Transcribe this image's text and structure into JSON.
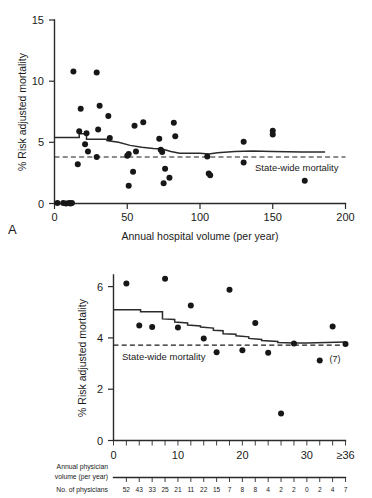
{
  "figure": {
    "panels": [
      {
        "letter": "A",
        "y_axis_title": "% Risk adjusted mortality",
        "x_axis_title": "Annual hospital volume (per year)",
        "annotation": "State-wide mortality"
      },
      {
        "letter": "B",
        "y_axis_title": "% Risk adjusted mortality",
        "x_axis_title_line1": "Annual physician",
        "x_axis_title_line2": "volume (per year)",
        "counts_label": "No. of physicians",
        "annotation": "State-wide mortality",
        "point_note": "(7)"
      }
    ]
  },
  "chart_data": [
    {
      "type": "scatter",
      "title": "A",
      "xlabel": "Annual hospital volume (per year)",
      "ylabel": "% Risk adjusted mortality",
      "xlim": [
        0,
        200
      ],
      "ylim": [
        0,
        15
      ],
      "xticks": [
        0,
        50,
        100,
        150,
        200
      ],
      "yticks": [
        0,
        5,
        10,
        15
      ],
      "xtick_labels": [
        "0",
        "50",
        "100",
        "150",
        "200"
      ],
      "ytick_labels": [
        "0",
        "5",
        "10",
        "15"
      ],
      "grid": false,
      "legend": "none",
      "points": [
        [
          2,
          0.05
        ],
        [
          6,
          0.05
        ],
        [
          8,
          0.0
        ],
        [
          10,
          0.05
        ],
        [
          11,
          0.0
        ],
        [
          12,
          0.05
        ],
        [
          13,
          10.8
        ],
        [
          16,
          3.2
        ],
        [
          17,
          5.9
        ],
        [
          18,
          7.75
        ],
        [
          21,
          4.85
        ],
        [
          22,
          5.75
        ],
        [
          23,
          4.25
        ],
        [
          29,
          10.7
        ],
        [
          29,
          3.8
        ],
        [
          30,
          6.05
        ],
        [
          31,
          8.0
        ],
        [
          37,
          7.15
        ],
        [
          38,
          5.35
        ],
        [
          50,
          3.9
        ],
        [
          51,
          4.05
        ],
        [
          51,
          1.45
        ],
        [
          54,
          2.6
        ],
        [
          55,
          6.35
        ],
        [
          56,
          4.25
        ],
        [
          61,
          6.65
        ],
        [
          72,
          5.3
        ],
        [
          73,
          4.4
        ],
        [
          74,
          4.2
        ],
        [
          75,
          1.65
        ],
        [
          76,
          2.85
        ],
        [
          79,
          2.1
        ],
        [
          82,
          6.6
        ],
        [
          83,
          5.5
        ],
        [
          105,
          3.85
        ],
        [
          106,
          2.45
        ],
        [
          107,
          2.3
        ],
        [
          130,
          5.05
        ],
        [
          130,
          3.35
        ],
        [
          150,
          5.65
        ],
        [
          150,
          5.95
        ],
        [
          172,
          1.85
        ]
      ],
      "statewide_mortality": 3.8,
      "statewide_line_x": [
        0,
        200
      ],
      "trend_line": [
        [
          0,
          5.4
        ],
        [
          17,
          5.4
        ],
        [
          17,
          5.7
        ],
        [
          22,
          5.7
        ],
        [
          22,
          5.25
        ],
        [
          36,
          5.25
        ],
        [
          36,
          5.15
        ],
        [
          44,
          5.0
        ],
        [
          52,
          4.75
        ],
        [
          60,
          4.6
        ],
        [
          68,
          4.5
        ],
        [
          74,
          4.45
        ],
        [
          80,
          4.25
        ],
        [
          86,
          4.1
        ],
        [
          100,
          4.1
        ],
        [
          106,
          4.05
        ],
        [
          112,
          4.15
        ],
        [
          124,
          4.25
        ],
        [
          136,
          4.3
        ],
        [
          150,
          4.25
        ],
        [
          170,
          4.2
        ],
        [
          186,
          4.2
        ]
      ]
    },
    {
      "type": "scatter",
      "title": "B",
      "xlabel": "Annual physician volume (per year)",
      "ylabel": "% Risk adjusted mortality",
      "xlim": [
        0,
        36
      ],
      "ylim": [
        0,
        6.45
      ],
      "xticks": [
        0,
        10,
        20,
        30,
        36
      ],
      "yticks": [
        0,
        2,
        4,
        6
      ],
      "xtick_labels": [
        "0",
        "10",
        "20",
        "30",
        "≥36"
      ],
      "ytick_labels": [
        "0",
        "2",
        "4",
        "6"
      ],
      "xtick_minor_step": 2,
      "grid": false,
      "legend": "none",
      "points": [
        [
          2,
          6.12
        ],
        [
          4,
          4.48
        ],
        [
          6,
          4.42
        ],
        [
          8,
          6.3
        ],
        [
          10,
          4.4
        ],
        [
          12,
          5.26
        ],
        [
          14,
          3.98
        ],
        [
          16,
          3.44
        ],
        [
          18,
          5.88
        ],
        [
          20,
          3.52
        ],
        [
          22,
          4.58
        ],
        [
          24,
          3.42
        ],
        [
          26,
          1.05
        ],
        [
          28,
          3.78
        ],
        [
          32,
          3.12
        ],
        [
          34,
          4.44
        ],
        [
          36,
          3.76
        ]
      ],
      "statewide_mortality": 3.72,
      "statewide_line_x": [
        0,
        36
      ],
      "point_note": "(7)",
      "point_note_at": [
        36,
        3.76
      ],
      "trend_line": [
        [
          0,
          5.1
        ],
        [
          4.2,
          5.1
        ],
        [
          4.2,
          5.02
        ],
        [
          7.6,
          5.02
        ],
        [
          7.6,
          4.74
        ],
        [
          9.5,
          4.72
        ],
        [
          9.5,
          4.62
        ],
        [
          11.5,
          4.58
        ],
        [
          11.5,
          4.5
        ],
        [
          13.5,
          4.46
        ],
        [
          13.5,
          4.42
        ],
        [
          15.5,
          4.38
        ],
        [
          15.5,
          4.3
        ],
        [
          17.0,
          4.28
        ],
        [
          17.0,
          4.16
        ],
        [
          19.0,
          4.14
        ],
        [
          19.0,
          4.08
        ],
        [
          21.0,
          4.04
        ],
        [
          21.0,
          3.98
        ],
        [
          23.0,
          3.94
        ],
        [
          23.0,
          3.9
        ],
        [
          25.5,
          3.86
        ],
        [
          25.5,
          3.82
        ],
        [
          28.0,
          3.8
        ],
        [
          30.0,
          3.8
        ],
        [
          33.0,
          3.82
        ],
        [
          36.0,
          3.84
        ]
      ],
      "physician_counts": [
        52,
        43,
        33,
        25,
        21,
        11,
        22,
        15,
        7,
        8,
        8,
        4,
        2,
        2,
        0,
        2,
        4,
        7
      ],
      "physician_counts_x": [
        2,
        4,
        6,
        8,
        10,
        12,
        14,
        16,
        18,
        20,
        22,
        24,
        26,
        28,
        30,
        32,
        34,
        36
      ]
    }
  ],
  "colors": {
    "ink": "#1a1a1a",
    "axis": "#2b2b2b",
    "point": "#171717",
    "background": "#ffffff"
  }
}
